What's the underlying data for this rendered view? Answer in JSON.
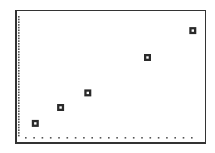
{
  "chart_data": {
    "type": "scatter",
    "title": "",
    "xlabel": "",
    "ylabel": "",
    "grid": false,
    "legend": null,
    "marker": "hollow-square",
    "note": "Graphing-calculator style scatter plot; no numeric tick labels shown. Values are in relative plot units (x: 0-10, y: 0-10) estimated from pixel positions.",
    "xlim": [
      0,
      10
    ],
    "ylim": [
      0,
      10
    ],
    "x": [
      0.9,
      2.3,
      3.8,
      7.1,
      9.6
    ],
    "y": [
      1.2,
      2.5,
      3.7,
      6.6,
      8.8
    ],
    "points": [
      {
        "x": 0.9,
        "y": 1.2
      },
      {
        "x": 2.3,
        "y": 2.5
      },
      {
        "x": 3.8,
        "y": 3.7
      },
      {
        "x": 7.1,
        "y": 6.6
      },
      {
        "x": 9.6,
        "y": 8.8
      }
    ],
    "axes": {
      "y_axis_style": "dense-dotted",
      "x_axis_style": "sparse-dotted"
    }
  },
  "colors": {
    "background": "#ffffff",
    "frame": "#333333",
    "axis_dots": "#555555",
    "marker": "#2a2a2a"
  },
  "layout": {
    "plot_left": 19,
    "plot_right": 200,
    "plot_top": 16,
    "plot_bottom": 138,
    "marker_pixels": [
      [
        35,
        123
      ],
      [
        60,
        107
      ],
      [
        85,
        93
      ],
      [
        144,
        57
      ],
      [
        187,
        30
      ]
    ]
  }
}
